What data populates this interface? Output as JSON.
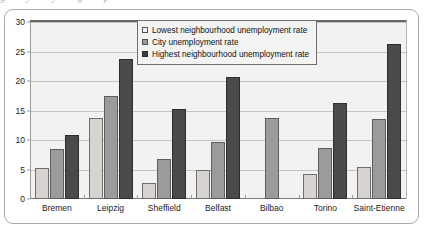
{
  "figure": {
    "caption_remnant": "g y y g p"
  },
  "chart_data": {
    "type": "bar",
    "title": "",
    "xlabel": "",
    "ylabel": "",
    "ylim": [
      0,
      30
    ],
    "ytick_step": 5,
    "yticks": [
      "0",
      "5",
      "10",
      "15",
      "20",
      "25",
      "30"
    ],
    "grid": true,
    "legend_position": "top-center",
    "categories": [
      "Bremen",
      "Leipzig",
      "Sheffield",
      "Belfast",
      "Bilbao",
      "Torino",
      "Saint-Etienne"
    ],
    "series": [
      {
        "name": "Lowest neighbourhood unemployment rate",
        "color": "#d7d4cf",
        "values": [
          5.2,
          13.7,
          2.7,
          4.9,
          null,
          4.2,
          5.5
        ]
      },
      {
        "name": "City unemployment rate",
        "color": "#9b9b9b",
        "values": [
          8.4,
          17.5,
          6.8,
          9.6,
          13.7,
          8.7,
          13.6
        ]
      },
      {
        "name": "Highest neighbourhood unemployment rate",
        "color": "#4a4a4a",
        "values": [
          10.9,
          23.8,
          15.2,
          20.6,
          null,
          16.2,
          26.2
        ]
      }
    ]
  }
}
